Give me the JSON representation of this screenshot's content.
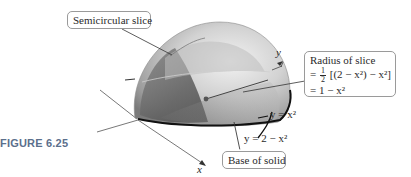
{
  "figure": {
    "label": "FIGURE 6.25"
  },
  "callouts": {
    "semicircular_slice": "Semicircular slice",
    "radius_title": "Radius of slice",
    "radius_line1_prefix": "=",
    "radius_line1_frac_num": "1",
    "radius_line1_frac_den": "2",
    "radius_line1_expr": "[(2 − x²) − x²]",
    "radius_line2": "= 1 − x²",
    "base_of_solid": "Base of solid"
  },
  "curves": {
    "lower": "y = x²",
    "upper": "y = 2 − x²"
  },
  "axes": {
    "x": "x",
    "y": "y"
  },
  "colors": {
    "figure_label": "#5b6f8c",
    "solid_light": "#e4e4e4",
    "solid_mid": "#a8a8a8",
    "solid_dark": "#5a5a5a",
    "axis": "#444444",
    "base_edge": "#111111"
  }
}
